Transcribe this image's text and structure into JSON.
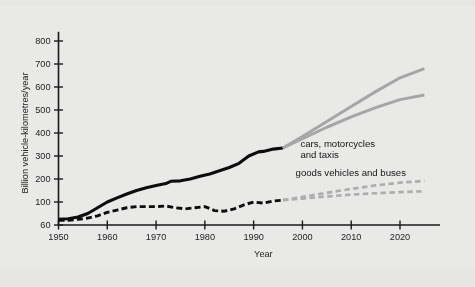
{
  "chart_data": {
    "type": "line",
    "title": "",
    "xlabel": "Year",
    "ylabel": "Billion vehicle-kilometres/year",
    "xlim": [
      1950,
      2027
    ],
    "ylim": [
      60,
      840
    ],
    "grid": false,
    "legend_position": "inline-annotations",
    "xticks": [
      1950,
      1960,
      1970,
      1980,
      1990,
      2000,
      2010,
      2020
    ],
    "xtick_labels": [
      "1950",
      "1960",
      "1970",
      "1980",
      "1990",
      "2000",
      "2010",
      "2020"
    ],
    "yticks": [
      60,
      100,
      200,
      300,
      400,
      500,
      600,
      700,
      800
    ],
    "ytick_labels": [
      "60",
      "100",
      "200",
      "300",
      "400",
      "500",
      "600",
      "700",
      "800"
    ],
    "annotations": [
      {
        "id": "cars-annotation",
        "text_line1": "cars, motorcycles",
        "text_line2": "and taxis",
        "x": 2003,
        "y": 330
      },
      {
        "id": "goods-annotation",
        "text_line1": "goods vehicles and buses",
        "text_line2": "",
        "x": 2001,
        "y": 205
      }
    ],
    "series": [
      {
        "name": "cars, motorcycles and taxis — historical",
        "style": "solid",
        "color": "#0d0d0d",
        "kind": "historical",
        "x": [
          1950,
          1952,
          1954,
          1956,
          1958,
          1960,
          1962,
          1964,
          1966,
          1968,
          1970,
          1972,
          1973,
          1975,
          1977,
          1979,
          1981,
          1983,
          1985,
          1987,
          1989,
          1991,
          1992,
          1994,
          1996
        ],
        "values": [
          70,
          71,
          74,
          80,
          90,
          100,
          118,
          135,
          150,
          162,
          172,
          180,
          190,
          192,
          200,
          212,
          222,
          236,
          250,
          268,
          300,
          318,
          320,
          330,
          335
        ]
      },
      {
        "name": "goods vehicles and buses — historical",
        "style": "dashed",
        "color": "#0d0d0d",
        "kind": "historical",
        "x": [
          1950,
          1952,
          1954,
          1956,
          1958,
          1960,
          1962,
          1964,
          1966,
          1968,
          1970,
          1972,
          1974,
          1976,
          1978,
          1980,
          1982,
          1984,
          1986,
          1988,
          1990,
          1992,
          1994,
          1996
        ],
        "values": [
          68,
          68,
          70,
          72,
          76,
          82,
          86,
          90,
          92,
          92,
          92,
          93,
          90,
          88,
          90,
          92,
          85,
          84,
          88,
          95,
          100,
          98,
          104,
          108
        ]
      },
      {
        "name": "cars, motorcycles and taxis — projection high",
        "style": "solid",
        "color": "#a8a8a8",
        "kind": "projection",
        "x": [
          1996,
          2000,
          2005,
          2010,
          2015,
          2020,
          2025
        ],
        "values": [
          335,
          385,
          450,
          515,
          580,
          640,
          680
        ]
      },
      {
        "name": "cars, motorcycles and taxis — projection low",
        "style": "solid",
        "color": "#a8a8a8",
        "kind": "projection",
        "x": [
          1996,
          2000,
          2005,
          2010,
          2015,
          2020,
          2025
        ],
        "values": [
          335,
          375,
          425,
          470,
          510,
          545,
          565
        ]
      },
      {
        "name": "goods vehicles and buses — projection high",
        "style": "dashed",
        "color": "#b0b0b0",
        "kind": "projection",
        "x": [
          1996,
          2000,
          2005,
          2010,
          2015,
          2020,
          2025
        ],
        "values": [
          108,
          122,
          140,
          157,
          172,
          184,
          192
        ]
      },
      {
        "name": "goods vehicles and buses — projection low",
        "style": "dashed",
        "color": "#b0b0b0",
        "kind": "projection",
        "x": [
          1996,
          2000,
          2005,
          2010,
          2015,
          2020,
          2025
        ],
        "values": [
          108,
          115,
          124,
          132,
          138,
          143,
          147
        ]
      }
    ]
  }
}
